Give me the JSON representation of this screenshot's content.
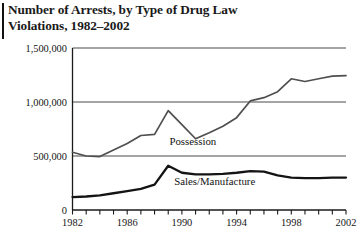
{
  "title": {
    "line1": "Number of Arrests, by Type of Drug Law",
    "line2": "Violations, 1982–2002"
  },
  "chart_data": {
    "type": "line",
    "title": "Number of Arrests, by Type of Drug Law Violations, 1982–2002",
    "xlabel": "",
    "ylabel": "",
    "xlim": [
      1982,
      2002
    ],
    "ylim": [
      0,
      1500000
    ],
    "grid": true,
    "gridlines_y": [
      500000,
      1000000,
      1500000
    ],
    "legend_position": "inline-labels",
    "y_ticks": [
      0,
      500000,
      1000000,
      1500000
    ],
    "y_tick_labels": [
      "0",
      "500,000",
      "1,000,000",
      "1,500,000"
    ],
    "x_ticks": [
      1982,
      1983,
      1984,
      1985,
      1986,
      1987,
      1988,
      1989,
      1990,
      1991,
      1992,
      1993,
      1994,
      1995,
      1996,
      1997,
      1998,
      1999,
      2000,
      2001,
      2002
    ],
    "x_tick_labels_shown": [
      "1982",
      "1986",
      "1990",
      "1994",
      "1998",
      "2002"
    ],
    "x": [
      1982,
      1983,
      1984,
      1985,
      1986,
      1987,
      1988,
      1989,
      1990,
      1991,
      1992,
      1993,
      1994,
      1995,
      1996,
      1997,
      1998,
      1999,
      2000,
      2001,
      2002
    ],
    "series": [
      {
        "name": "Possession",
        "color": "#4f4f4f",
        "label_x": 1990.8,
        "label_y": 600000,
        "values": [
          535000,
          500000,
          495000,
          555000,
          615000,
          690000,
          700000,
          920000,
          790000,
          660000,
          715000,
          775000,
          855000,
          1010000,
          1040000,
          1095000,
          1215000,
          1190000,
          1215000,
          1240000,
          1245000
        ]
      },
      {
        "name": "Sales/Manufacture",
        "color": "#141414",
        "label_x": 1992.4,
        "label_y": 230000,
        "values": [
          120000,
          125000,
          135000,
          155000,
          175000,
          195000,
          235000,
          410000,
          345000,
          330000,
          330000,
          335000,
          345000,
          360000,
          355000,
          320000,
          300000,
          295000,
          295000,
          300000,
          300000
        ]
      }
    ],
    "annotations": [
      {
        "text": "Possession",
        "x": 1990.8,
        "y": 600000
      },
      {
        "text": "Sales/Manufacture",
        "x": 1992.4,
        "y": 230000
      }
    ]
  }
}
